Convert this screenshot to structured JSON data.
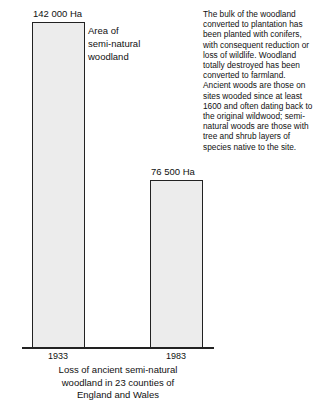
{
  "chart_data": {
    "type": "bar",
    "title": "Loss of ancient semi-natural woodland in 23 counties of England and Wales",
    "categories": [
      "1933",
      "1983"
    ],
    "values": [
      142000,
      76500
    ],
    "value_labels": [
      "142 000 Ha",
      "76 500 Ha"
    ],
    "series": [
      {
        "name": "Area of semi-natural woodland",
        "values": [
          142000,
          76500
        ]
      }
    ],
    "xlabel": "",
    "ylabel": "Area of semi-natural woodland",
    "unit": "Ha",
    "ylim": [
      0,
      142000
    ],
    "grid": false,
    "legend_position": "inline-right-of-first-bar",
    "bar_fill_color": "#ececec",
    "bar_border_color": "#222222",
    "axis_color": "#222222",
    "text_color": "#111111",
    "background_color": "#ffffff"
  },
  "chart": {
    "bars": [
      {
        "year": "1933",
        "value_label": "142 000 Ha"
      },
      {
        "year": "1983",
        "value_label": "76 500 Ha"
      }
    ],
    "series_legend": {
      "line1": "Area of",
      "line2": "semi-natural",
      "line3": "woodland"
    },
    "caption": {
      "line1": "Loss of ancient semi-natural",
      "line2": "woodland in 23 counties of",
      "line3": "England and Wales"
    }
  },
  "note": {
    "paragraph": "The bulk of the woodland converted to plantation has been planted with conifers, with consequent reduction or loss of wildlife. Woodland totally destroyed has been converted to farmland. Ancient woods are those on sites wooded since at least 1600 and often dating back to the original wildwood; semi-natural woods are those with tree and shrub layers of species native to the site."
  }
}
